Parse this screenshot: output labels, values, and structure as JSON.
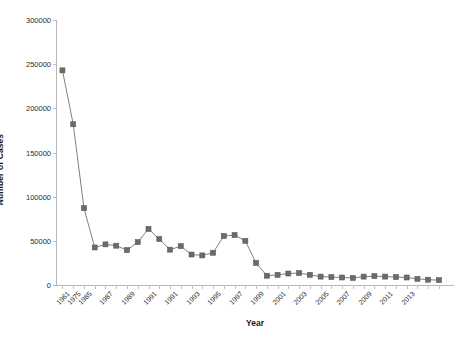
{
  "chart_data": {
    "type": "line",
    "title": "",
    "subtitle": "",
    "xlabel": "Year",
    "ylabel": "Number of Cases",
    "xlim": [
      0,
      37
    ],
    "ylim": [
      0,
      300000
    ],
    "grid": false,
    "legend": null,
    "legend_position": "none",
    "marker": "square",
    "series_color": "#6b6b6b",
    "line_color": "#808080",
    "y_ticks": [
      0,
      50000,
      100000,
      150000,
      200000,
      250000,
      300000
    ],
    "y_tick_labels": [
      "0",
      "50000",
      "100000",
      "150000",
      "200000",
      "250000",
      "300000"
    ],
    "x_tick_labels": [
      "1961",
      "1975",
      "1985",
      "1987",
      "1989",
      "1991",
      "1991",
      "1993",
      "1995",
      "1997",
      "1999",
      "2001",
      "2003",
      "2005",
      "2007",
      "2009",
      "2011",
      "2013"
    ],
    "categories": [
      "1961",
      "1975",
      "1983",
      "1985",
      "1986",
      "1987",
      "1988",
      "1989",
      "1990",
      "1991",
      "1992",
      "1993",
      "1994",
      "1995",
      "1996",
      "1997",
      "1998",
      "1999",
      "2000",
      "2001",
      "2002",
      "2003",
      "2004",
      "2005",
      "2006",
      "2007",
      "2008",
      "2009",
      "2010",
      "2011",
      "2012",
      "2013",
      "2014",
      "2015",
      "2016",
      "2017"
    ],
    "values": [
      243000,
      182000,
      87000,
      42500,
      46000,
      44500,
      39500,
      48500,
      63500,
      52000,
      40000,
      44000,
      34500,
      33500,
      36500,
      55500,
      56500,
      50000,
      25000,
      10500,
      11500,
      13000,
      13500,
      11500,
      9500,
      9000,
      8500,
      8000,
      9500,
      10000,
      9500,
      9000,
      8500,
      7000,
      6000,
      5500
    ],
    "x_label_indices": [
      0,
      1,
      2,
      4,
      6,
      8,
      10,
      12,
      14,
      16,
      18,
      20,
      22,
      24,
      26,
      28,
      30,
      32
    ]
  }
}
